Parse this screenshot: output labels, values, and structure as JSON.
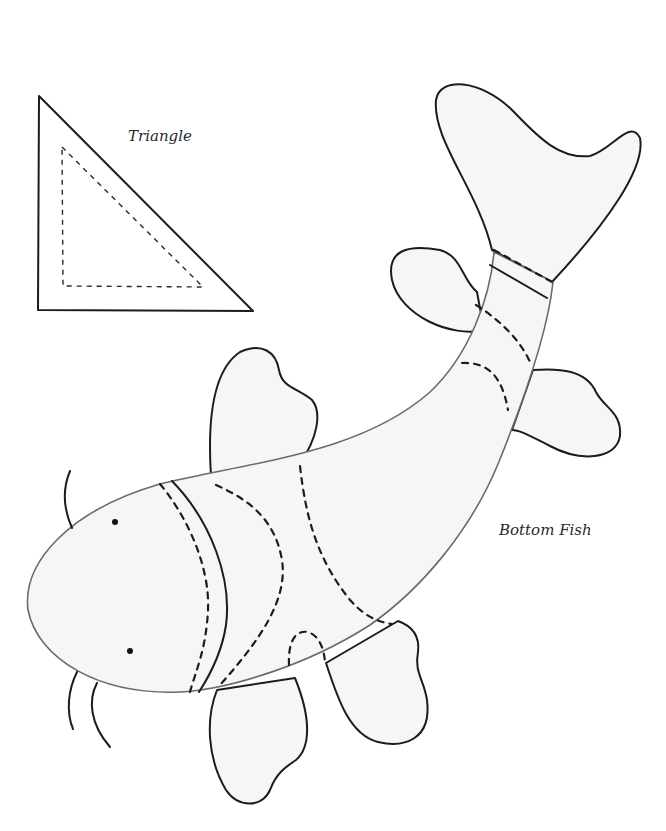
{
  "labels": {
    "triangle": "Triangle",
    "fish": "Bottom Fish"
  },
  "pieces": [
    {
      "name": "Triangle",
      "seam_line": "dashed",
      "cut_line": "solid"
    },
    {
      "name": "Bottom Fish",
      "seam_line": "dashed",
      "cut_line": "solid",
      "eyes": 2,
      "whiskers": 3,
      "fins": 5
    }
  ],
  "colors": {
    "line": "#1c1c1c",
    "fill": "#f6f6f6",
    "background": "#ffffff"
  }
}
